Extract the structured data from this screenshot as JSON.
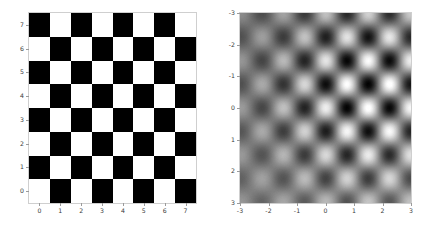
{
  "figure": {
    "width": 435,
    "height": 228,
    "background": "#ffffff",
    "panel_count": 2
  },
  "chart_data": [
    {
      "id": "left",
      "type": "heatmap",
      "title": "",
      "xlabel": "",
      "ylabel": "",
      "interpolation": "nearest",
      "colormap": "gray",
      "origin": "upper",
      "extent": [
        -0.5,
        7.5,
        7.5,
        -0.5
      ],
      "xlim": [
        -0.5,
        7.5
      ],
      "ylim": [
        7.5,
        -0.5
      ],
      "xticks": [
        0,
        1,
        2,
        3,
        4,
        5,
        6,
        7
      ],
      "yticks": [
        0,
        1,
        2,
        3,
        4,
        5,
        6,
        7
      ],
      "xticklabels": [
        "0",
        "1",
        "2",
        "3",
        "4",
        "5",
        "6",
        "7"
      ],
      "yticklabels": [
        "0",
        "1",
        "2",
        "3",
        "4",
        "5",
        "6",
        "7"
      ],
      "grid": false,
      "legend": null,
      "nrows": 8,
      "ncols": 8,
      "vmin": 0,
      "vmax": 1,
      "values": [
        [
          0,
          1,
          0,
          1,
          0,
          1,
          0,
          1
        ],
        [
          1,
          0,
          1,
          0,
          1,
          0,
          1,
          0
        ],
        [
          0,
          1,
          0,
          1,
          0,
          1,
          0,
          1
        ],
        [
          1,
          0,
          1,
          0,
          1,
          0,
          1,
          0
        ],
        [
          0,
          1,
          0,
          1,
          0,
          1,
          0,
          1
        ],
        [
          1,
          0,
          1,
          0,
          1,
          0,
          1,
          0
        ],
        [
          0,
          1,
          0,
          1,
          0,
          1,
          0,
          1
        ],
        [
          1,
          0,
          1,
          0,
          1,
          0,
          1,
          0
        ]
      ]
    },
    {
      "id": "right",
      "type": "heatmap",
      "title": "",
      "xlabel": "",
      "ylabel": "",
      "interpolation": "bicubic",
      "colormap": "gray",
      "origin": "upper",
      "extent": [
        -3,
        3,
        -3,
        3
      ],
      "xlim": [
        -3,
        3
      ],
      "ylim": [
        -3,
        3
      ],
      "xticks": [
        -3,
        -2,
        -1,
        0,
        1,
        2,
        3
      ],
      "yticks": [
        -3,
        -2,
        -1,
        0,
        1,
        2,
        3
      ],
      "xticklabels": [
        "-3",
        "-2",
        "-1",
        "0",
        "1",
        "2",
        "3"
      ],
      "yticklabels": [
        "-3",
        "-2",
        "-1",
        "0",
        "1",
        "2",
        "3"
      ],
      "grid": false,
      "legend": null,
      "nrows": 8,
      "ncols": 8,
      "vmin": 0,
      "vmax": 1,
      "contrast_center": [
        1.5,
        0.5
      ],
      "contrast_falloff": "radial-fade-to-midgray-at-edges",
      "values": [
        [
          0,
          1,
          0,
          1,
          0,
          1,
          0,
          1
        ],
        [
          1,
          0,
          1,
          0,
          1,
          0,
          1,
          0
        ],
        [
          0,
          1,
          0,
          1,
          0,
          1,
          0,
          1
        ],
        [
          1,
          0,
          1,
          0,
          1,
          0,
          1,
          0
        ],
        [
          0,
          1,
          0,
          1,
          0,
          1,
          0,
          1
        ],
        [
          1,
          0,
          1,
          0,
          1,
          0,
          1,
          0
        ],
        [
          0,
          1,
          0,
          1,
          0,
          1,
          0,
          1
        ],
        [
          1,
          0,
          1,
          0,
          1,
          0,
          1,
          0
        ]
      ]
    }
  ]
}
